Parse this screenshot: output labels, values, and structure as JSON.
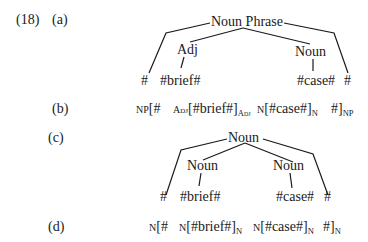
{
  "example": {
    "number": "(18)",
    "parts": {
      "a": {
        "label": "(a)",
        "root": "Noun Phrase",
        "children": [
          "Adj",
          "Noun"
        ],
        "leaves": [
          "#",
          "#brief#",
          "#case#",
          "#"
        ]
      },
      "b": {
        "label": "(b)",
        "bracketing": {
          "outer_open_sub": "NP",
          "outer_open": "[#",
          "adj_sub": "Adj",
          "adj_content": "[#brief#]",
          "adj_close_sub": "Adj",
          "n_sub": "N",
          "n_content": "[#case#]",
          "n_close_sub": "N",
          "outer_close": "#]",
          "outer_close_sub": "NP"
        }
      },
      "c": {
        "label": "(c)",
        "root": "Noun",
        "children": [
          "Noun",
          "Noun"
        ],
        "leaves": [
          "#",
          "#brief#",
          "#case#",
          "#"
        ]
      },
      "d": {
        "label": "(d)",
        "bracketing": {
          "outer_open_sub": "N",
          "outer_open": "[#",
          "n1_sub": "N",
          "n1_content": "[#brief#]",
          "n1_close_sub": "N",
          "n2_sub": "N",
          "n2_content": "[#case#]",
          "n2_close_sub": "N",
          "outer_close": "#]",
          "outer_close_sub": "N"
        }
      }
    }
  }
}
